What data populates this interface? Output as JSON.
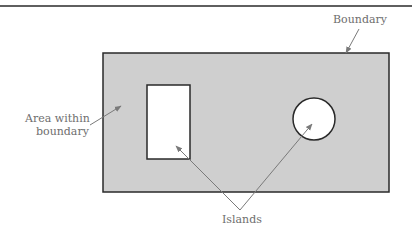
{
  "diagram": {
    "labels": {
      "boundary": "Boundary",
      "area_line1": "Area within",
      "area_line2": "boundary",
      "islands": "Islands"
    },
    "colors": {
      "fill": "#cfcfcf",
      "stroke": "#2a2a2a",
      "arrow": "#7a7a7a",
      "text": "#6e6e6e"
    },
    "shapes": {
      "boundary_rect": "outer rectangle",
      "island_rect": "rectangular island",
      "island_circle": "circular island"
    }
  }
}
